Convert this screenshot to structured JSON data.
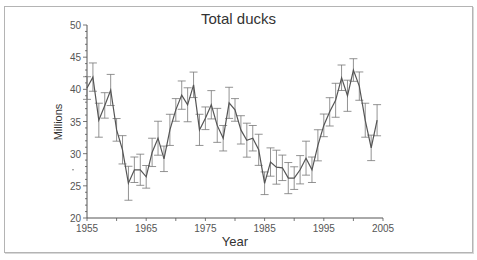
{
  "chart_data": {
    "type": "line",
    "title": "Total ducks",
    "xlabel": "Year",
    "ylabel": "Millions",
    "xlim": [
      1955,
      2005
    ],
    "ylim": [
      20,
      50
    ],
    "x_ticks": [
      1955,
      1965,
      1975,
      1985,
      1995,
      2005
    ],
    "y_ticks": [
      20,
      25,
      30,
      35,
      40,
      45,
      50
    ],
    "grid": false,
    "legend": null,
    "error_bars": true,
    "series": [
      {
        "name": "Total ducks",
        "x": [
          1955,
          1956,
          1957,
          1958,
          1959,
          1960,
          1961,
          1962,
          1963,
          1964,
          1965,
          1966,
          1967,
          1968,
          1969,
          1970,
          1971,
          1972,
          1973,
          1974,
          1975,
          1976,
          1977,
          1978,
          1979,
          1980,
          1981,
          1982,
          1983,
          1984,
          1985,
          1986,
          1987,
          1988,
          1989,
          1990,
          1991,
          1992,
          1993,
          1994,
          1995,
          1996,
          1997,
          1998,
          1999,
          2000,
          2001,
          2002,
          2003,
          2004
        ],
        "values": [
          40.2,
          41.9,
          35.2,
          37.5,
          39.9,
          33.7,
          30.6,
          25.4,
          27.5,
          27.5,
          26.4,
          30.2,
          32.4,
          29.2,
          33.7,
          36.8,
          39.1,
          37.6,
          40.7,
          33.7,
          35.5,
          37.6,
          34.4,
          32.4,
          37.9,
          36.8,
          33.7,
          32.1,
          32.4,
          30.6,
          25.4,
          28.7,
          27.9,
          27.8,
          26.2,
          26.2,
          27.5,
          29.3,
          27.5,
          31.3,
          34.4,
          36.5,
          38.3,
          41.8,
          39.0,
          43.0,
          40.5,
          35.2,
          30.9,
          35.2
        ],
        "error": 2.2
      }
    ]
  },
  "colors": {
    "line": "#555555",
    "axis": "#555555",
    "text": "#444444",
    "frame": "#b4b4b4"
  }
}
